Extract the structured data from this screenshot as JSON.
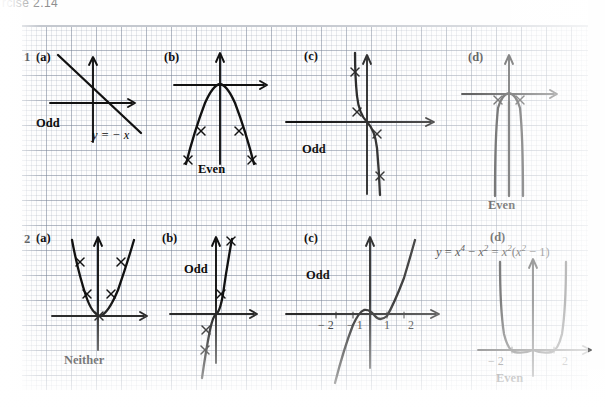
{
  "scan": {
    "header_text": "rcise 2.14",
    "background": "#fdfdfd",
    "grid_color": "#7882 96",
    "ink_color": "#111111"
  },
  "rows": [
    {
      "number": "1",
      "panels": [
        {
          "tag": "(a)",
          "label": "Odd",
          "equation": "y = − x",
          "curve": "line-negative-slope",
          "ticks": []
        },
        {
          "tag": "(b)",
          "label": "Even",
          "equation": "",
          "curve": "downward-parabola",
          "ticks": []
        },
        {
          "tag": "(c)",
          "label": "Odd",
          "equation": "",
          "curve": "decreasing-cubic",
          "ticks": []
        },
        {
          "tag": "(d)",
          "label": "Even",
          "equation": "",
          "curve": "narrow-downward-quartic",
          "ticks": []
        }
      ]
    },
    {
      "number": "2",
      "panels": [
        {
          "tag": "(a)",
          "label": "Neither",
          "equation": "",
          "curve": "shifted-upward-parabola",
          "ticks": []
        },
        {
          "tag": "(b)",
          "label": "Odd",
          "equation": "",
          "curve": "increasing-cubic",
          "ticks": []
        },
        {
          "tag": "(c)",
          "label": "Odd",
          "equation": "",
          "curve": "odd-quintic",
          "ticks": [
            "− 2",
            "− 1",
            "1",
            "2"
          ]
        },
        {
          "tag": "(d)",
          "label": "Even",
          "equation_parts": {
            "lhs": "y",
            "eq1": "=",
            "t1": "x",
            "e1": "4",
            "minus": "−",
            "t2": "x",
            "e2": "2",
            "eq2": "=",
            "t3": "x",
            "e3": "2",
            "open": "(",
            "t4": "x",
            "e4": "2",
            "minus2": "−",
            "one": "1",
            "close": ")"
          },
          "equation_plain": "y = x⁴ − x² = x²(x² − 1)",
          "curve": "quartic-w-shape",
          "ticks": [
            "− 2",
            "2"
          ]
        }
      ]
    }
  ]
}
